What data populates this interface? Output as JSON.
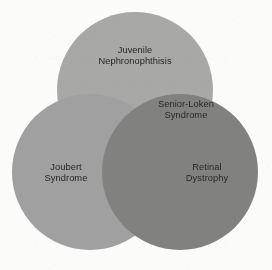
{
  "figure": {
    "kind": "venn-diagram",
    "set_count": 3,
    "background_color": "#fbfbfa",
    "label_color": "#212121"
  },
  "chart_data": {
    "type": "venn",
    "title": "",
    "sets": [
      {
        "id": "juvenile-nephronophthisis",
        "label": "Juvenile\nNephronophthisis",
        "color": "#ababab",
        "cx": 135,
        "cy": 90,
        "r": 78,
        "label_x": 135,
        "label_y": 56
      },
      {
        "id": "joubert-syndrome",
        "label": "Joubert\nSyndrome",
        "color": "#a3a3a3",
        "cx": 90,
        "cy": 172,
        "r": 78,
        "label_x": 66,
        "label_y": 173
      },
      {
        "id": "retinal-dystrophy",
        "label": "Retinal\nDystrophy",
        "color": "#838383",
        "cx": 180,
        "cy": 172,
        "r": 78,
        "label_x": 207,
        "label_y": 173
      }
    ],
    "intersections": [
      {
        "id": "senior-loken-syndrome",
        "label": "Senior-Loken\nSyndrome",
        "members": [
          "juvenile-nephronophthisis",
          "retinal-dystrophy"
        ],
        "label_x": 186,
        "label_y": 110
      }
    ]
  }
}
